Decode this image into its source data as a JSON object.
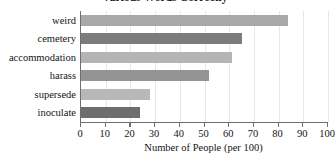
{
  "chart_data": {
    "type": "bar",
    "orientation": "horizontal",
    "title": "Various Words Correctly",
    "xlabel": "Number of People (per 100)",
    "ylabel": "",
    "categories": [
      "weird",
      "cemetery",
      "accommodation",
      "harass",
      "supersede",
      "inoculate"
    ],
    "values": [
      84,
      65,
      61,
      52,
      28,
      24
    ],
    "xlim": [
      0,
      100
    ],
    "xticks": [
      0,
      10,
      20,
      30,
      40,
      50,
      60,
      70,
      80,
      90,
      100
    ],
    "xticklabels": [
      "0",
      "10",
      "20",
      "30",
      "40",
      "50",
      "60",
      "70",
      "80",
      "90",
      "100"
    ],
    "grid": true,
    "legend": false,
    "bar_colors": [
      "#a8a8a8",
      "#7c7c7c",
      "#b4b4b4",
      "#949494",
      "#b8b8b8",
      "#6e6e6e"
    ]
  },
  "style": {
    "background": "#ffffff",
    "axis_color": "#6f6f6f",
    "grid_color": "#e6e6e6",
    "text_color": "#141414"
  }
}
